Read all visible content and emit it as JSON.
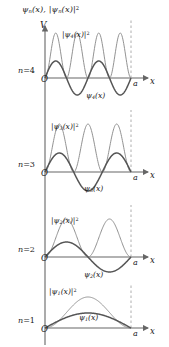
{
  "figure": {
    "title_axis": "ψn(x), |ψn(x)|²",
    "vertical_axis_label": "V",
    "horizontal_axis_label": "x",
    "origin_label": "O",
    "well_width_label": "a",
    "colors": {
      "psi_curve": "#555555",
      "density_curve": "#8c8c8c",
      "axis": "#666666",
      "dashed_boundary": "#999999",
      "text": "#1a1a1a",
      "background": "#ffffff"
    },
    "panels": [
      {
        "level_label": "n=4",
        "n": 4,
        "density_label": "|ψ4(x)|²",
        "psi_label": "ψ4(x)",
        "baseline_y": 78,
        "psi_amplitude": 17,
        "density_amplitude": 45
      },
      {
        "level_label": "n=3",
        "n": 3,
        "density_label": "|ψ3(x)|²",
        "psi_label": "ψ3(x)",
        "baseline_y": 172,
        "psi_amplitude": 19,
        "density_amplitude": 48
      },
      {
        "level_label": "n=2",
        "n": 2,
        "density_label": "|ψ2(x)|²",
        "psi_label": "ψ2(x)",
        "baseline_y": 257,
        "psi_amplitude": 15,
        "density_amplitude": 38
      },
      {
        "level_label": "n=1",
        "n": 1,
        "density_label": "|ψ1(x)|²",
        "psi_label": "ψ1(x)",
        "baseline_y": 328,
        "psi_amplitude": 15,
        "density_amplitude": 31
      }
    ]
  },
  "chart_data": {
    "type": "line",
    "xlabel": "x",
    "ylabel": "V",
    "grid": false,
    "legend": "inline-annotations",
    "xlim": [
      0,
      1
    ],
    "x_tick_labels": [
      "O",
      "a"
    ],
    "series": [
      {
        "name": "ψ4(x)",
        "n": 4,
        "panel": 4,
        "form": "sin(4*pi*x/a)",
        "nodes_interior": 3,
        "sign_pattern": [
          "+",
          "-",
          "+",
          "-"
        ]
      },
      {
        "name": "|ψ4(x)|²",
        "n": 4,
        "panel": 4,
        "form": "sin^2(4*pi*x/a)",
        "peaks": 4,
        "peak_positions_over_a": [
          0.125,
          0.375,
          0.625,
          0.875
        ]
      },
      {
        "name": "ψ3(x)",
        "n": 3,
        "panel": 3,
        "form": "sin(3*pi*x/a)",
        "nodes_interior": 2,
        "sign_pattern": [
          "+",
          "-",
          "+"
        ]
      },
      {
        "name": "|ψ3(x)|²",
        "n": 3,
        "panel": 3,
        "form": "sin^2(3*pi*x/a)",
        "peaks": 3,
        "peak_positions_over_a": [
          0.1667,
          0.5,
          0.8333
        ]
      },
      {
        "name": "ψ2(x)",
        "n": 2,
        "panel": 2,
        "form": "sin(2*pi*x/a)",
        "nodes_interior": 1,
        "sign_pattern": [
          "+",
          "-"
        ]
      },
      {
        "name": "|ψ2(x)|²",
        "n": 2,
        "panel": 2,
        "form": "sin^2(2*pi*x/a)",
        "peaks": 2,
        "peak_positions_over_a": [
          0.25,
          0.75
        ]
      },
      {
        "name": "ψ1(x)",
        "n": 1,
        "panel": 1,
        "form": "sin(pi*x/a)",
        "nodes_interior": 0,
        "sign_pattern": [
          "+"
        ]
      },
      {
        "name": "|ψ1(x)|²",
        "n": 1,
        "panel": 1,
        "form": "sin^2(pi*x/a)",
        "peaks": 1,
        "peak_positions_over_a": [
          0.5
        ]
      }
    ]
  }
}
